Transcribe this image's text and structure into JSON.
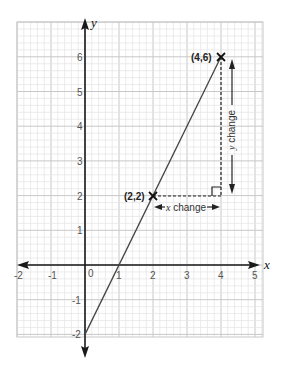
{
  "chart_data": {
    "type": "line",
    "title": "",
    "xlabel": "x",
    "ylabel": "y",
    "xlim": [
      -2,
      5
    ],
    "ylim": [
      -2,
      6.6
    ],
    "x_ticks": [
      "-2",
      "-1",
      "0",
      "1",
      "2",
      "3",
      "4",
      "5"
    ],
    "y_ticks": [
      "-2",
      "-1",
      "1",
      "2",
      "3",
      "4",
      "5",
      "6"
    ],
    "grid": true,
    "minor_grid_subdivisions": 5,
    "series": [
      {
        "name": "line",
        "equation": "y = 2x - 2",
        "x": [
          0,
          4
        ],
        "y": [
          -2,
          6
        ]
      }
    ],
    "points": [
      {
        "label": "(2,2)",
        "x": 2,
        "y": 2,
        "marker": "x"
      },
      {
        "label": "(4,6)",
        "x": 4,
        "y": 6,
        "marker": "x"
      }
    ],
    "annotations": [
      {
        "text_var": "x",
        "text_rest": " change",
        "from": [
          2,
          2
        ],
        "to": [
          4,
          2
        ],
        "orientation": "horizontal"
      },
      {
        "text_var": "y",
        "text_rest": " change",
        "from": [
          4,
          2
        ],
        "to": [
          4,
          6
        ],
        "orientation": "vertical"
      }
    ]
  },
  "labels": {
    "x_axis": "x",
    "y_axis": "y",
    "origin": "0",
    "point_a": "(2,2)",
    "point_b": "(4,6)",
    "x_change_var": "x",
    "x_change_rest": " change",
    "y_change_var": "y",
    "y_change_rest": " change"
  },
  "colors": {
    "grid_minor": "#e4e4e4",
    "grid_major": "#c8c8c8",
    "axis": "#1a1a1a",
    "line": "#444444",
    "dashed": "#222222"
  }
}
